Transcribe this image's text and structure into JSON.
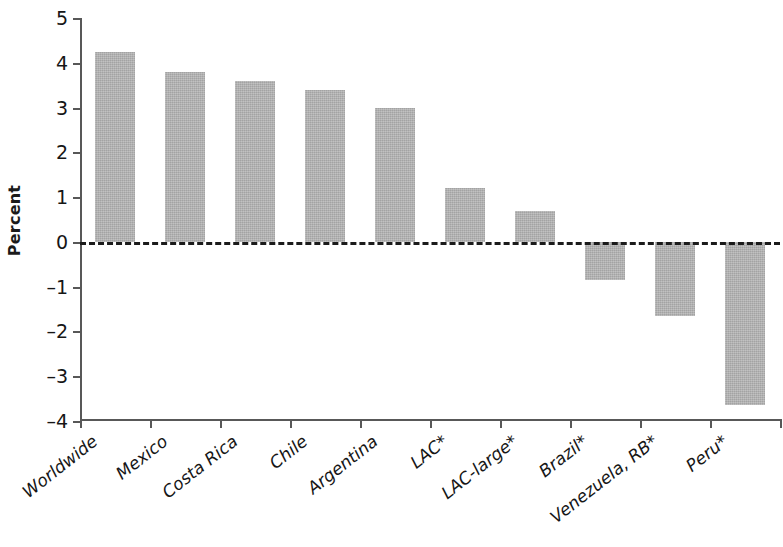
{
  "chart_data": {
    "type": "bar",
    "title": "",
    "xlabel": "",
    "ylabel": "Percent",
    "categories": [
      "Worldwide",
      "Mexico",
      "Costa Rica",
      "Chile",
      "Argentina",
      "LAC*",
      "LAC-large*",
      "Brazil*",
      "Venezuela, RB*",
      "Peru*"
    ],
    "values": [
      4.25,
      3.8,
      3.6,
      3.4,
      3.0,
      1.2,
      0.7,
      -0.85,
      -1.65,
      -3.65
    ],
    "ylim": [
      -4,
      5
    ],
    "ytick_labels": [
      "5",
      "4",
      "3",
      "2",
      "1",
      "0",
      "–1",
      "–2",
      "–3",
      "–4"
    ],
    "ytick_values": [
      5,
      4,
      3,
      2,
      1,
      0,
      -1,
      -2,
      -3,
      -4
    ],
    "grid": false,
    "legend": false,
    "zero_reference_line": true,
    "bar_color": "#b4b4b4",
    "axis_color": "#585858",
    "text_color": "#161616"
  }
}
